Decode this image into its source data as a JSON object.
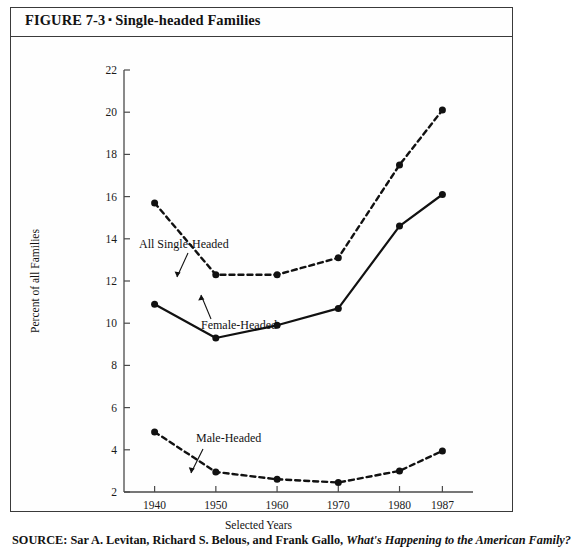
{
  "figure": {
    "label": "FIGURE 7-3",
    "separator": "▪",
    "title": "Single-headed Families",
    "full_title": "FIGURE 7-3 ▪ Single-headed Families"
  },
  "source": {
    "prefix": "SOURCE: Sar A. Levitan, Richard S. Belous, and Frank Gallo, ",
    "italic_part": "What's Happening to the American Family?"
  },
  "chart_data": {
    "type": "line",
    "title": "Single-headed Families",
    "xlabel": "Selected Years",
    "ylabel": "Percent of all Families",
    "x": [
      "1940",
      "1950",
      "1960",
      "1970",
      "1980",
      "1987"
    ],
    "xlim": [
      1935,
      1992
    ],
    "ylim": [
      2,
      22
    ],
    "yticks": [
      2,
      4,
      6,
      8,
      10,
      12,
      14,
      16,
      18,
      20,
      22
    ],
    "grid": false,
    "legend": "inline-annotations",
    "series": [
      {
        "name": "All Single-Headed",
        "style": "dashed",
        "marker": "filled-circle",
        "values": [
          15.7,
          12.3,
          12.3,
          13.1,
          17.5,
          20.1
        ]
      },
      {
        "name": "Female-Headed",
        "style": "solid",
        "marker": "filled-circle",
        "values": [
          10.9,
          9.3,
          9.9,
          10.7,
          14.6,
          16.1
        ]
      },
      {
        "name": "Male-Headed",
        "style": "dashed",
        "marker": "filled-circle",
        "values": [
          4.85,
          2.95,
          2.6,
          2.45,
          3.0,
          3.95
        ]
      }
    ],
    "annotations": [
      {
        "text": "All Single-Headed",
        "attached_to": "All Single-Headed"
      },
      {
        "text": "Female-Headed",
        "attached_to": "Female-Headed"
      },
      {
        "text": "Male-Headed",
        "attached_to": "Male-Headed"
      }
    ],
    "colors": {
      "line": "#111111",
      "axis": "#4a4a4a",
      "background": "#ffffff"
    }
  }
}
